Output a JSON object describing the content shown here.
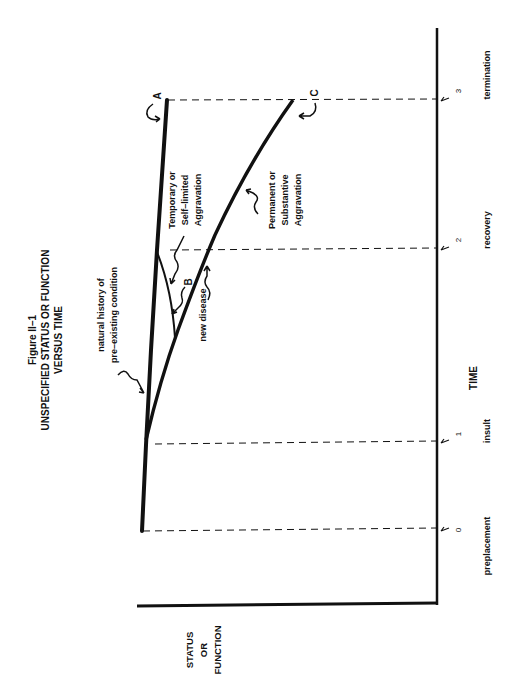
{
  "figure": {
    "number": "Figure II–1",
    "title_line1": "UNSPECIFIED STATUS OR FUNCTION",
    "title_line2": "VERSUS TIME",
    "orientation": "rotated 90° counter-clockwise"
  },
  "axes": {
    "y_label_line1": "STATUS",
    "y_label_line2": "OR",
    "y_label_line3": "FUNCTION",
    "x_label": "TIME"
  },
  "ticks": [
    {
      "symbol": "t",
      "sub": "0",
      "event": "preplacement"
    },
    {
      "symbol": "t",
      "sub": "1",
      "event": "insult"
    },
    {
      "symbol": "t",
      "sub": "2",
      "event": "recovery"
    },
    {
      "symbol": "t",
      "sub": "3",
      "event": "termination"
    }
  ],
  "annotations": {
    "natural_history_line1": "natural history of",
    "natural_history_line2": "pre–existing condition",
    "new_disease": "new disease",
    "temporary_line1": "Temporary or",
    "temporary_line2": "Self–limited",
    "temporary_line3": "Aggravation",
    "permanent_line1": "Permanent or",
    "permanent_line2": "Substantive",
    "permanent_line3": "Aggravation",
    "label_A": "A",
    "label_B": "B",
    "label_C": "C"
  },
  "colors": {
    "ink": "#111111",
    "background": "#ffffff"
  }
}
